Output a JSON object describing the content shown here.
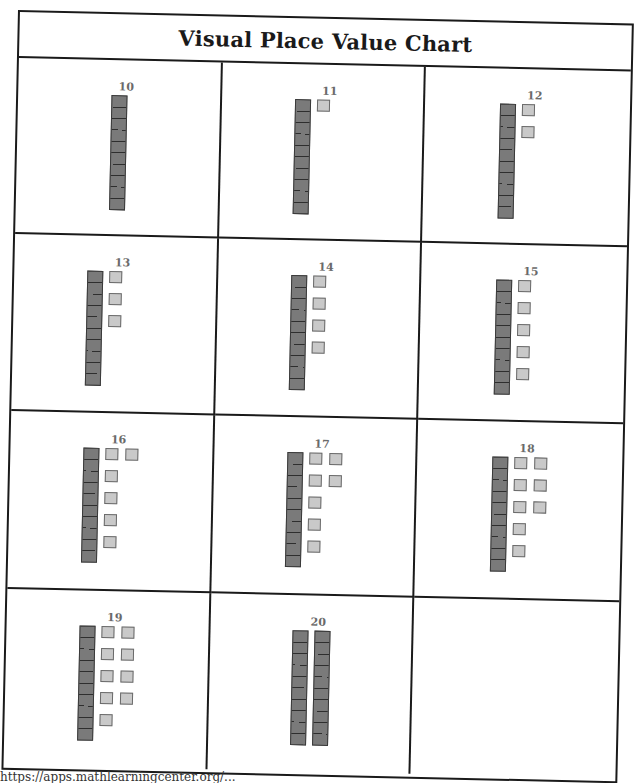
{
  "title": "Visual Place Value Chart",
  "footer_url": "https://apps.mathlearningcenter.org/...",
  "colors": {
    "tens_rod": "#7a7a7a",
    "ones_cube": "#c9c9c9",
    "grid_line": "#1a1a1a",
    "number_label": "#6a6a6a"
  },
  "cells": [
    {
      "label": "10",
      "tens": 1,
      "ones": 0
    },
    {
      "label": "11",
      "tens": 1,
      "ones": 1
    },
    {
      "label": "12",
      "tens": 1,
      "ones": 2
    },
    {
      "label": "13",
      "tens": 1,
      "ones": 3
    },
    {
      "label": "14",
      "tens": 1,
      "ones": 4
    },
    {
      "label": "15",
      "tens": 1,
      "ones": 5
    },
    {
      "label": "16",
      "tens": 1,
      "ones": 6
    },
    {
      "label": "17",
      "tens": 1,
      "ones": 7
    },
    {
      "label": "18",
      "tens": 1,
      "ones": 8
    },
    {
      "label": "19",
      "tens": 1,
      "ones": 9
    },
    {
      "label": "20",
      "tens": 2,
      "ones": 0
    },
    {
      "label": "",
      "tens": 0,
      "ones": 0
    }
  ]
}
